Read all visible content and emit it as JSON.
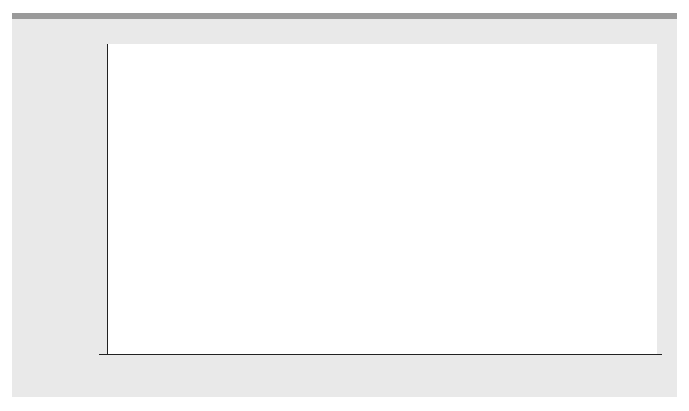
{
  "chart_data": {
    "type": "bar",
    "title": "",
    "xlabel": "",
    "ylabel": "Alzheimer’s Cases (millions)",
    "categories": [
      "2000",
      "2010",
      "2020",
      "2030",
      "2040",
      "2050"
    ],
    "values": [
      4.5,
      5.1,
      5.7,
      7.7,
      11.0,
      13.2
    ],
    "value_labels": [
      "4.5",
      "5.1",
      "5.7",
      "7.7",
      "11.0",
      "13.2"
    ],
    "ylim": [
      0,
      16
    ],
    "yticks": [
      "0",
      "2",
      "4",
      "6",
      "8",
      "10",
      "12",
      "14",
      "16"
    ],
    "grid": false,
    "legend": null,
    "bar_color": "#787878",
    "background_color": "#e9e9e9",
    "plot_background": "#ffffff"
  }
}
